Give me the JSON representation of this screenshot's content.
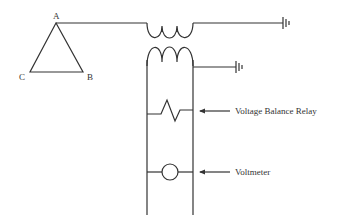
{
  "diagram": {
    "type": "circuit-schematic",
    "delta_connection": {
      "nodes": [
        {
          "label": "A"
        },
        {
          "label": "B"
        },
        {
          "label": "C"
        }
      ]
    },
    "transformer": {
      "primary_turns_drawn": 3,
      "secondary_turns_drawn": 3
    },
    "components": [
      {
        "name": "voltage-balance-relay",
        "label": "Voltage Balance Relay"
      },
      {
        "name": "voltmeter",
        "label": "Voltmeter"
      }
    ],
    "grounds": 2,
    "colors": {
      "line": "#333333",
      "background": "#ffffff"
    }
  }
}
